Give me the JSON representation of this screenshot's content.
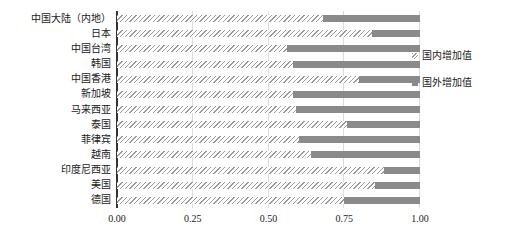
{
  "chart_data": {
    "type": "bar",
    "variant": "horizontal-stacked",
    "title": "",
    "xlabel": "",
    "ylabel": "",
    "xlim": [
      0,
      1
    ],
    "x_ticks": [
      "0.00",
      "0.25",
      "0.50",
      "0.75",
      "1.00"
    ],
    "grid": "vertical quarter gridlines on",
    "legend_position": "right",
    "categories": [
      "中国大陆（内地）",
      "日本",
      "中国台湾",
      "韩国",
      "中国香港",
      "新加坡",
      "马来西亚",
      "泰国",
      "菲律宾",
      "越南",
      "印度尼西亚",
      "美国",
      "德国"
    ],
    "series": [
      {
        "name": "国内增加值",
        "style": "hatched",
        "values": [
          0.68,
          0.84,
          0.56,
          0.58,
          0.8,
          0.58,
          0.59,
          0.76,
          0.6,
          0.64,
          0.88,
          0.85,
          0.75
        ]
      },
      {
        "name": "国外增加值",
        "style": "solid",
        "values": [
          0.32,
          0.16,
          0.44,
          0.42,
          0.2,
          0.42,
          0.41,
          0.24,
          0.4,
          0.36,
          0.12,
          0.15,
          0.25
        ]
      }
    ],
    "colors": {
      "solid_bar": "#8a8a8a",
      "hatch_line": "#9b9b9b",
      "axis_line": "#333333",
      "gridline": "#dcdcdc",
      "text": "#1a1a1a"
    }
  }
}
